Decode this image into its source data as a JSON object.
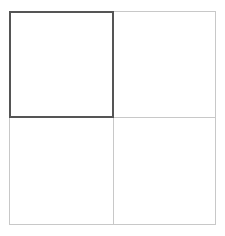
{
  "grid": {
    "rows": 2,
    "columns": 2,
    "selected_cell": "top-left",
    "colors": {
      "selected_border": "#555555",
      "grid_line": "#c8c8c8",
      "background": "#ffffff"
    },
    "cells": [
      {
        "position": "top-left",
        "label": "",
        "selected": true
      },
      {
        "position": "top-right",
        "label": "",
        "selected": false
      },
      {
        "position": "bottom-left",
        "label": "",
        "selected": false
      },
      {
        "position": "bottom-right",
        "label": "",
        "selected": false
      }
    ]
  }
}
